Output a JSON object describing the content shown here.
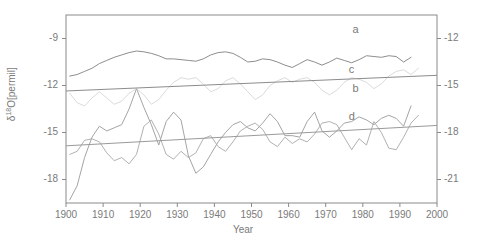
{
  "chart_data": {
    "type": "line",
    "title": "",
    "xlabel": "Year",
    "ylabel": "δ¹⁸O[permil]",
    "ylabel_base": "δ",
    "ylabel_sup": "18",
    "ylabel_rest": "O[permil]",
    "xlim": [
      1900,
      2000
    ],
    "xticks": [
      1900,
      1910,
      1920,
      1930,
      1940,
      1950,
      1960,
      1970,
      1980,
      1990,
      2000
    ],
    "xtick_labels": [
      "1900",
      "1910",
      "1920",
      "1930",
      "1940",
      "1950",
      "1960",
      "1970",
      "1980",
      "1990",
      "2000"
    ],
    "ylim_left": [
      -19.5,
      -7.5
    ],
    "yticks_left": [
      -9,
      -12,
      -15,
      -18
    ],
    "ytick_labels_left": [
      "-9",
      "-12",
      "-15",
      "-18"
    ],
    "ylim_right": [
      -22.5,
      -10.5
    ],
    "yticks_right": [
      -12,
      -15,
      -18,
      -21
    ],
    "ytick_labels_right": [
      "-12",
      "-15",
      "-18",
      "-21"
    ],
    "grid": false,
    "legend_position": "inline-right",
    "series": [
      {
        "name": "a",
        "label": "a",
        "axis": "left",
        "color": "#808080",
        "label_x": 1978,
        "label_y": -8.55,
        "x": [
          1901,
          1903,
          1905,
          1907,
          1909,
          1911,
          1913,
          1915,
          1917,
          1919,
          1921,
          1923,
          1925,
          1927,
          1929,
          1931,
          1933,
          1935,
          1937,
          1939,
          1941,
          1943,
          1945,
          1947,
          1949,
          1951,
          1953,
          1955,
          1957,
          1959,
          1961,
          1963,
          1965,
          1967,
          1969,
          1971,
          1973,
          1975,
          1977,
          1979,
          1981,
          1983,
          1985,
          1987,
          1989,
          1991,
          1993
        ],
        "y": [
          -11.4,
          -11.3,
          -11.1,
          -10.9,
          -10.6,
          -10.4,
          -10.2,
          -10.05,
          -9.9,
          -9.8,
          -9.85,
          -9.95,
          -10.1,
          -10.3,
          -10.3,
          -10.35,
          -10.4,
          -10.45,
          -10.3,
          -10.05,
          -9.9,
          -9.85,
          -9.95,
          -10.2,
          -10.5,
          -10.45,
          -10.3,
          -10.35,
          -10.5,
          -10.7,
          -10.85,
          -10.6,
          -10.35,
          -10.5,
          -10.7,
          -10.5,
          -10.25,
          -10.4,
          -10.55,
          -10.35,
          -10.1,
          -10.15,
          -10.2,
          -10.1,
          -10.15,
          -10.5,
          -10.2
        ]
      },
      {
        "name": "b",
        "label": "b",
        "axis": "left",
        "color": "#9a9a9a",
        "label_x": 1978,
        "label_y": -12.3,
        "x": [
          1901,
          1903,
          1905,
          1907,
          1909,
          1911,
          1913,
          1915,
          1917,
          1919,
          1921,
          1923,
          1925,
          1927,
          1929,
          1931,
          1933,
          1935,
          1937,
          1939,
          1941,
          1943,
          1945,
          1947,
          1949,
          1951,
          1953,
          1955,
          1957,
          1959,
          1961,
          1963,
          1965,
          1967,
          1969,
          1971,
          1973,
          1975,
          1977,
          1979,
          1981,
          1983,
          1985,
          1987,
          1989,
          1991,
          1993
        ],
        "y": [
          -19.3,
          -18.4,
          -16.6,
          -15.3,
          -14.6,
          -14.9,
          -14.7,
          -14.5,
          -13.5,
          -12.2,
          -13.4,
          -14.5,
          -15.8,
          -14.3,
          -13.7,
          -14.2,
          -16.5,
          -17.6,
          -17.2,
          -16.4,
          -15.6,
          -15.0,
          -14.5,
          -14.3,
          -14.7,
          -14.9,
          -14.4,
          -13.8,
          -14.3,
          -15.2,
          -15.2,
          -15.3,
          -14.3,
          -13.7,
          -14.9,
          -15.3,
          -14.9,
          -14.4,
          -14.3,
          -14.0,
          -14.2,
          -14.5,
          -14.1,
          -13.9,
          -14.1,
          -14.6,
          -13.3
        ]
      },
      {
        "name": "c",
        "label": "c",
        "axis": "right",
        "color": "#d6d6d6",
        "trend_color": "#8c8c8c",
        "trend_from": -15.35,
        "trend_to": -14.35,
        "label_x": 1977,
        "label_y": -14.05,
        "x": [
          1901,
          1903,
          1905,
          1907,
          1909,
          1911,
          1913,
          1915,
          1917,
          1919,
          1921,
          1923,
          1925,
          1927,
          1929,
          1931,
          1933,
          1935,
          1937,
          1939,
          1941,
          1943,
          1945,
          1947,
          1949,
          1951,
          1953,
          1955,
          1957,
          1959,
          1961,
          1963,
          1965,
          1967,
          1969,
          1971,
          1973,
          1975,
          1977,
          1979,
          1981,
          1983,
          1985,
          1987,
          1989,
          1991,
          1993,
          1995
        ],
        "y": [
          -15.5,
          -16.1,
          -16.3,
          -15.8,
          -15.4,
          -15.8,
          -16.2,
          -16.0,
          -15.5,
          -15.2,
          -15.6,
          -16.2,
          -15.9,
          -15.3,
          -14.8,
          -14.5,
          -14.6,
          -14.5,
          -14.9,
          -15.4,
          -15.2,
          -14.7,
          -14.5,
          -14.9,
          -15.4,
          -15.9,
          -15.6,
          -15.0,
          -14.7,
          -14.5,
          -14.8,
          -14.6,
          -14.5,
          -14.8,
          -15.3,
          -15.6,
          -15.3,
          -14.8,
          -14.5,
          -14.6,
          -14.8,
          -15.2,
          -14.9,
          -14.4,
          -14.1,
          -14.0,
          -14.3,
          -13.9
        ]
      },
      {
        "name": "d",
        "label": "d",
        "axis": "right",
        "color": "#a8a8a8",
        "trend_color": "#9a9a9a",
        "trend_from": -18.85,
        "trend_to": -17.55,
        "label_x": 1977,
        "label_y": -17.05,
        "x": [
          1901,
          1903,
          1905,
          1907,
          1909,
          1911,
          1913,
          1915,
          1917,
          1919,
          1921,
          1923,
          1925,
          1927,
          1929,
          1931,
          1933,
          1935,
          1937,
          1939,
          1941,
          1943,
          1945,
          1947,
          1949,
          1951,
          1953,
          1955,
          1957,
          1959,
          1961,
          1963,
          1965,
          1967,
          1969,
          1971,
          1973,
          1975,
          1977,
          1979,
          1981,
          1983,
          1985,
          1987,
          1989,
          1991,
          1993,
          1995
        ],
        "y": [
          -19.4,
          -19.2,
          -18.5,
          -18.4,
          -18.6,
          -19.3,
          -19.8,
          -19.6,
          -20.0,
          -19.4,
          -17.6,
          -17.2,
          -18.1,
          -19.4,
          -19.7,
          -19.2,
          -19.6,
          -19.3,
          -18.4,
          -18.2,
          -18.9,
          -19.2,
          -18.6,
          -17.9,
          -17.6,
          -17.4,
          -17.8,
          -18.6,
          -18.9,
          -18.3,
          -18.7,
          -18.4,
          -18.6,
          -18.1,
          -17.4,
          -17.3,
          -17.5,
          -18.3,
          -19.1,
          -18.4,
          -18.8,
          -17.3,
          -18.0,
          -19.0,
          -19.1,
          -18.3,
          -17.4,
          -16.9
        ]
      }
    ]
  }
}
